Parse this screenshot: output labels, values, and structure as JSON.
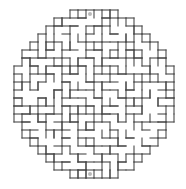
{
  "figure": {
    "kind": "maze-puzzle",
    "shape": "circle",
    "background_color": "#ffffff",
    "wall_color": "#4a4a4a",
    "marker_color": "#b9b9b9",
    "wall_thickness": 1.1,
    "canvas": {
      "width": 186,
      "height": 189
    }
  },
  "grid": {
    "cell_size": 8,
    "origin_x": 14,
    "origin_y": 10,
    "cols": 20,
    "rows": 21,
    "mask_shape": "ellipse",
    "mask_center_col": 10,
    "mask_center_row": 10.5,
    "mask_radius_cols": 10,
    "mask_radius_rows": 10.5
  },
  "markers": [
    {
      "name": "entrance",
      "label": "start",
      "col": 9,
      "row": 0,
      "position": "top-center"
    },
    {
      "name": "exit",
      "label": "finish",
      "col": 9,
      "row": 20,
      "position": "bottom-center"
    }
  ],
  "walls": {
    "h": [
      [
        0,
        8,
        9
      ],
      [
        1,
        6,
        7,
        8,
        11,
        12,
        13
      ],
      [
        2,
        4,
        5,
        7,
        10,
        14,
        15
      ],
      [
        3,
        3,
        6,
        9,
        12,
        16
      ],
      [
        4,
        2,
        5,
        8,
        11,
        13,
        17
      ],
      [
        5,
        1,
        4,
        7,
        10,
        14,
        18
      ],
      [
        6,
        1,
        3,
        6,
        9,
        12,
        15,
        18
      ],
      [
        7,
        0,
        2,
        5,
        8,
        11,
        16,
        19
      ],
      [
        8,
        0,
        4,
        7,
        10,
        13,
        17,
        19
      ],
      [
        9,
        0,
        3,
        6,
        9,
        12,
        15,
        19
      ],
      [
        10,
        0,
        2,
        5,
        8,
        11,
        14,
        18,
        19
      ],
      [
        11,
        0,
        3,
        7,
        10,
        13,
        16,
        19
      ],
      [
        12,
        0,
        2,
        6,
        9,
        12,
        15,
        19
      ],
      [
        13,
        1,
        4,
        8,
        11,
        14,
        18
      ],
      [
        14,
        1,
        3,
        7,
        10,
        13,
        17,
        18
      ],
      [
        15,
        1,
        5,
        9,
        12,
        16,
        18
      ],
      [
        16,
        2,
        6,
        8,
        11,
        14,
        17
      ],
      [
        17,
        3,
        5,
        9,
        13,
        16
      ],
      [
        18,
        4,
        7,
        10,
        12,
        15
      ],
      [
        19,
        6,
        8,
        11,
        13
      ],
      [
        20,
        8,
        9,
        10
      ],
      [
        21,
        9
      ]
    ],
    "v": [
      [
        0,
        8,
        10
      ],
      [
        1,
        6,
        9,
        11,
        13
      ],
      [
        2,
        4,
        6,
        8,
        12,
        15
      ],
      [
        3,
        3,
        5,
        9,
        13,
        16
      ],
      [
        4,
        2,
        4,
        7,
        11,
        14,
        17
      ],
      [
        5,
        1,
        3,
        6,
        10,
        12,
        15,
        18
      ],
      [
        6,
        1,
        5,
        8,
        11,
        14,
        16,
        19
      ],
      [
        7,
        0,
        2,
        4,
        7,
        10,
        13,
        17,
        20
      ],
      [
        8,
        0,
        3,
        6,
        9,
        12,
        15,
        18,
        20
      ],
      [
        9,
        0,
        2,
        5,
        8,
        11,
        14,
        16,
        19,
        20
      ],
      [
        10,
        0,
        4,
        7,
        10,
        13,
        17,
        20
      ],
      [
        11,
        0,
        3,
        6,
        9,
        12,
        15,
        18,
        20
      ],
      [
        12,
        0,
        2,
        5,
        8,
        11,
        14,
        17,
        20
      ],
      [
        13,
        1,
        4,
        7,
        10,
        13,
        16,
        19
      ],
      [
        14,
        1,
        3,
        6,
        9,
        12,
        15,
        18
      ],
      [
        15,
        2,
        5,
        8,
        11,
        14,
        17
      ],
      [
        16,
        3,
        6,
        9,
        12,
        16
      ],
      [
        17,
        4,
        7,
        10,
        13
      ],
      [
        18,
        5,
        8,
        11
      ],
      [
        19,
        6,
        9,
        12
      ],
      [
        20,
        8,
        10
      ]
    ]
  }
}
